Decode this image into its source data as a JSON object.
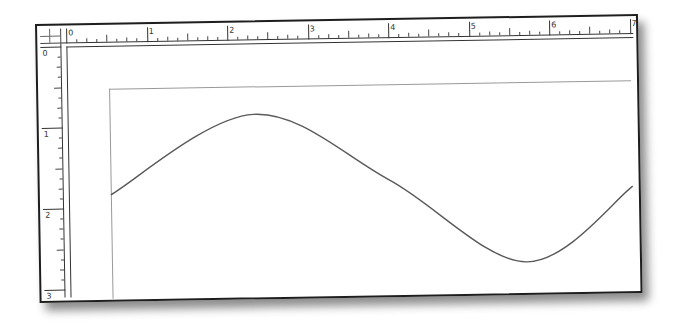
{
  "canvas": {
    "units": "inches",
    "ruler_top": {
      "labels": [
        "0",
        "1",
        "2",
        "3",
        "4",
        "5",
        "6",
        "7"
      ],
      "major_spacing_px": 80.5,
      "minor_ticks_per_major": 8
    },
    "ruler_left": {
      "labels": [
        "0",
        "1",
        "2",
        "3"
      ],
      "major_spacing_px": 81,
      "minor_ticks_per_major": 8
    },
    "shapes": [
      {
        "type": "curve",
        "description": "sine-wave path",
        "stroke": "#5a5a5a",
        "points": [
          [
            71,
            170
          ],
          [
            215,
            92
          ],
          [
            350,
            160
          ],
          [
            485,
            244
          ],
          [
            593,
            170
          ]
        ]
      }
    ],
    "margin_guide": {
      "stroke": "#999999"
    }
  },
  "colors": {
    "window_border": "#1e1e1e",
    "ruler_ink": "#333333",
    "curve": "#5a5a5a"
  }
}
